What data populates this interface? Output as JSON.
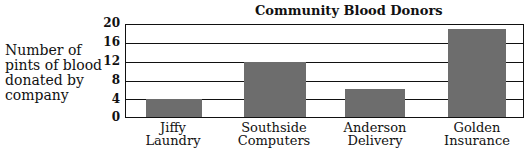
{
  "chart_data": {
    "type": "bar",
    "title": "Community Blood Donors",
    "xlabel": "",
    "ylabel": "Number of pints of blood donated by company",
    "categories": [
      "Jiffy Laundry",
      "Southside Computers",
      "Anderson Delivery",
      "Golden Insurance"
    ],
    "values": [
      4,
      12,
      6,
      19
    ],
    "ylim": [
      0,
      20
    ],
    "yticks": [
      0,
      4,
      8,
      12,
      16,
      20
    ],
    "grid": true,
    "legend": null
  },
  "labels": {
    "title": "Community Blood Donors",
    "ylabel": "Number of pints of blood donated by company",
    "ticks": [
      "20",
      "16",
      "12",
      "8",
      "4",
      "0"
    ],
    "cats": [
      [
        "Jiffy",
        "Laundry"
      ],
      [
        "Southside",
        "Computers"
      ],
      [
        "Anderson",
        "Delivery"
      ],
      [
        "Golden",
        "Insurance"
      ]
    ]
  }
}
